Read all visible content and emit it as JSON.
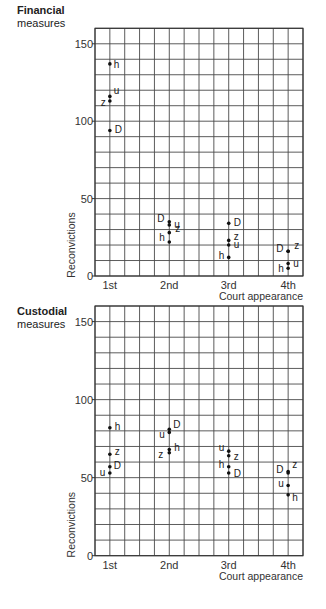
{
  "chart_data": [
    {
      "type": "scatter",
      "title": "Financial measures",
      "title_lines": [
        "Financial",
        "measures"
      ],
      "xlabel": "Court appearance",
      "ylabel": "Reconvictions",
      "categories": [
        "1st",
        "2nd",
        "3rd",
        "4th"
      ],
      "yticks": [
        0,
        50,
        100,
        150
      ],
      "ylim": [
        0,
        160
      ],
      "grid": true,
      "grid_step_y": 10,
      "grid_columns": 14,
      "series": [
        {
          "name": "D",
          "values": [
            94,
            35,
            34,
            16
          ]
        },
        {
          "name": "u",
          "values": [
            116,
            33,
            20,
            8
          ]
        },
        {
          "name": "z",
          "values": [
            113,
            28,
            23,
            16
          ]
        },
        {
          "name": "h",
          "values": [
            137,
            22,
            12,
            5
          ]
        }
      ]
    },
    {
      "type": "scatter",
      "title": "Custodial measures",
      "title_lines": [
        "Custodial",
        "measures"
      ],
      "xlabel": "Court appearance",
      "ylabel": "Reconvictions",
      "categories": [
        "1st",
        "2nd",
        "3rd",
        "4th"
      ],
      "yticks": [
        0,
        50,
        100,
        150
      ],
      "ylim": [
        0,
        160
      ],
      "grid": true,
      "grid_step_y": 10,
      "grid_columns": 14,
      "series": [
        {
          "name": "D",
          "values": [
            57,
            81,
            53,
            53
          ]
        },
        {
          "name": "u",
          "values": [
            53,
            79,
            67,
            45
          ]
        },
        {
          "name": "z",
          "values": [
            65,
            66,
            64,
            54
          ]
        },
        {
          "name": "h",
          "values": [
            82,
            68,
            57,
            39
          ]
        }
      ]
    }
  ],
  "label_offsets": {
    "0": {
      "D": [
        [
          5,
          3
        ],
        [
          -12,
          0
        ],
        [
          5,
          3
        ],
        [
          -12,
          1
        ]
      ],
      "u": [
        [
          4,
          -2
        ],
        [
          5,
          3
        ],
        [
          5,
          3
        ],
        [
          5,
          3
        ]
      ],
      "z": [
        [
          -9,
          5
        ],
        [
          6,
          -1
        ],
        [
          5,
          0
        ],
        [
          6,
          -2
        ]
      ],
      "h": [
        [
          4,
          4
        ],
        [
          -10,
          -1
        ],
        [
          -10,
          2
        ],
        [
          -10,
          4
        ]
      ]
    },
    "1": {
      "D": [
        [
          4,
          2
        ],
        [
          4,
          -1
        ],
        [
          5,
          4
        ],
        [
          -12,
          0
        ]
      ],
      "u": [
        [
          -10,
          3
        ],
        [
          -10,
          6
        ],
        [
          -10,
          0
        ],
        [
          -10,
          2
        ]
      ],
      "z": [
        [
          5,
          1
        ],
        [
          -11,
          5
        ],
        [
          5,
          4
        ],
        [
          4,
          -3
        ]
      ],
      "h": [
        [
          5,
          2
        ],
        [
          5,
          1
        ],
        [
          -10,
          1
        ],
        [
          4,
          6
        ]
      ]
    }
  }
}
